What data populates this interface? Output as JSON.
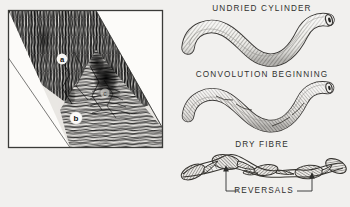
{
  "figure": {
    "background_color": "#f1f0ee",
    "ink_color": "#2e2e2c"
  },
  "left_panel": {
    "name": "micrograph-plate",
    "frame": {
      "x": 8,
      "y": 10,
      "width": 155,
      "height": 138
    },
    "description": "Photomicrograph of a cut fibre section showing a diagonal band of striated fibres running from upper left to lower right",
    "markers": [
      {
        "id": "a",
        "label": "a",
        "x": 62,
        "y": 59,
        "style": "white-dot-dark-letter"
      },
      {
        "id": "b",
        "label": "b",
        "x": 76,
        "y": 118,
        "style": "white-circle-dark-letter"
      },
      {
        "id": "c",
        "label": "c",
        "x": 105,
        "y": 93,
        "style": "faint-marker"
      }
    ]
  },
  "right_panel": {
    "name": "fibre-stages-diagram",
    "stages": [
      {
        "id": "undried-cylinder",
        "label": "UNDRIED CYLINDER",
        "label_x": 262,
        "label_y": 5,
        "shape": "smooth-s-curved-tube",
        "has_lumen_opening": true
      },
      {
        "id": "convolution-beginning",
        "label": "CONVOLUTION BEGINNING",
        "label_x": 262,
        "label_y": 71,
        "shape": "flattening-s-curved-tube",
        "has_lumen_opening": true
      },
      {
        "id": "dry-fibre",
        "label": "DRY FIBRE",
        "label_x": 262,
        "label_y": 141,
        "shape": "twisted-ribbon",
        "has_lumen_opening": false
      }
    ],
    "annotation": {
      "label": "REVERSALS",
      "label_x": 264,
      "label_y": 191,
      "arrows": [
        {
          "id": "reversal-arrow-left",
          "x": 226,
          "tip_y": 165,
          "tail_y": 190
        },
        {
          "id": "reversal-arrow-right",
          "x": 312,
          "tip_y": 171,
          "tail_y": 190
        }
      ]
    }
  }
}
